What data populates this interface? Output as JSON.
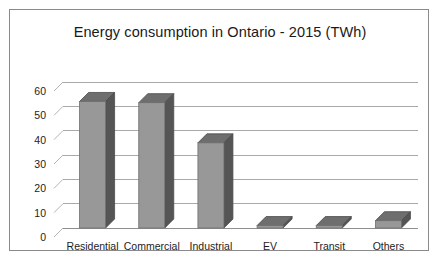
{
  "chart_data": {
    "type": "bar",
    "title": "Energy consumption in Ontario - 2015 (TWh)",
    "xlabel": "",
    "ylabel": "",
    "categories": [
      "Residential",
      "Commercial",
      "Industrial",
      "EV",
      "Transit",
      "Others"
    ],
    "values": [
      52,
      51.5,
      35,
      1,
      1,
      3
    ],
    "ylim": [
      0,
      60
    ],
    "yticks": [
      0,
      10,
      20,
      30,
      40,
      50,
      60
    ],
    "ytick_labels": [
      "0",
      "10",
      "20",
      "30",
      "40",
      "50",
      "60"
    ],
    "grid": true,
    "legend": false,
    "style": "3d-column",
    "colors": {
      "bar_front": "#989898",
      "bar_side": "#555555",
      "bar_top": "#6e6e6e",
      "gridline": "#a9a9a9",
      "frame_border": "#8a8a8a",
      "background": "#ffffff",
      "text": "#1d1d1d"
    }
  }
}
